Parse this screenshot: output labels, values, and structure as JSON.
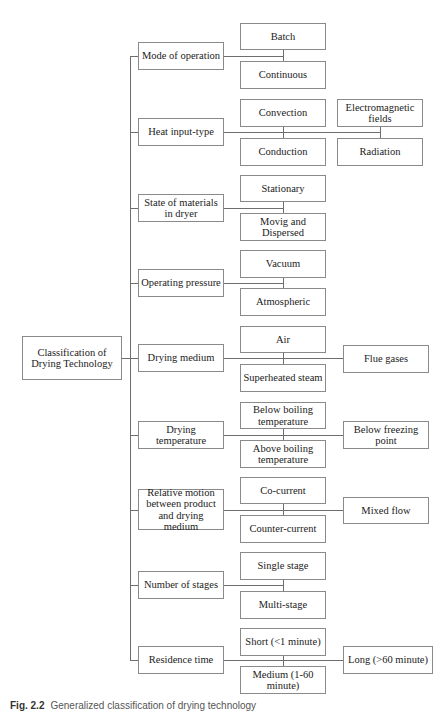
{
  "diagram": {
    "root": "Classification of Drying Technology",
    "categories": [
      {
        "label": "Mode of operation",
        "children": [
          "Batch",
          "Continuous"
        ],
        "side": []
      },
      {
        "label": "Heat input-type",
        "children": [
          "Convection",
          "Conduction"
        ],
        "side": [
          "Electromagnetic fields",
          "Radiation"
        ]
      },
      {
        "label": "State of materials in dryer",
        "children": [
          "Stationary",
          "Movig and Dispersed"
        ],
        "side": []
      },
      {
        "label": "Operating pressure",
        "children": [
          "Vacuum",
          "Atmospheric"
        ],
        "side": []
      },
      {
        "label": "Drying medium",
        "children": [
          "Air",
          "Superheated steam"
        ],
        "side": [
          "Flue gases"
        ]
      },
      {
        "label": "Drying temperature",
        "children": [
          "Below boiling temperature",
          "Above boiling temperature"
        ],
        "side": [
          "Below freezing point"
        ]
      },
      {
        "label": "Relative motion between product and drying medium",
        "children": [
          "Co-current",
          "Counter-current"
        ],
        "side": [
          "Mixed flow"
        ]
      },
      {
        "label": "Number of stages",
        "children": [
          "Single stage",
          "Multi-stage"
        ],
        "side": []
      },
      {
        "label": "Residence time",
        "children": [
          "Short (<1 minute)",
          "Medium (1-60 minute)"
        ],
        "side": [
          "Long (>60 minute)"
        ]
      }
    ]
  },
  "caption": {
    "number": "Fig. 2.2",
    "text": "Generalized classification of drying technology"
  }
}
